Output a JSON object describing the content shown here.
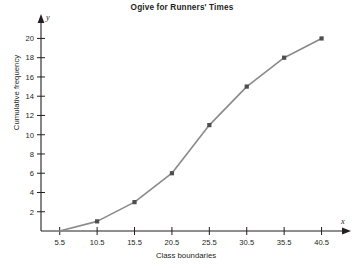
{
  "chart_data": {
    "type": "line",
    "title": "Ogive for Runners' Times",
    "xlabel": "Class boundaries",
    "ylabel": "Cumulative frequency",
    "x_axis_letter": "y",
    "y_axis_letter": "x",
    "x": [
      5.5,
      10.5,
      15.5,
      20.5,
      25.5,
      30.5,
      35.5,
      40.5
    ],
    "values": [
      0,
      1,
      3,
      6,
      11,
      15,
      18,
      20
    ],
    "xtick_labels": [
      "5.5",
      "10.5",
      "15.5",
      "20.5",
      "25.5",
      "30.5",
      "35.5",
      "40.5"
    ],
    "ytick_labels": [
      "2",
      "4",
      "6",
      "8",
      "10",
      "12",
      "14",
      "16",
      "18",
      "20"
    ],
    "yticks": [
      2,
      4,
      6,
      8,
      10,
      12,
      14,
      16,
      18,
      20
    ],
    "xlim": [
      3.0,
      43.5
    ],
    "ylim": [
      0,
      21.5
    ],
    "grid": false,
    "legend": false,
    "line_color": "#8a8a8a",
    "marker_color": "#4d4d52",
    "marker_shape": "square",
    "axis_color": "#231f20",
    "background": "#ffffff"
  },
  "axis_letters": {
    "x": "x",
    "y": "y"
  }
}
